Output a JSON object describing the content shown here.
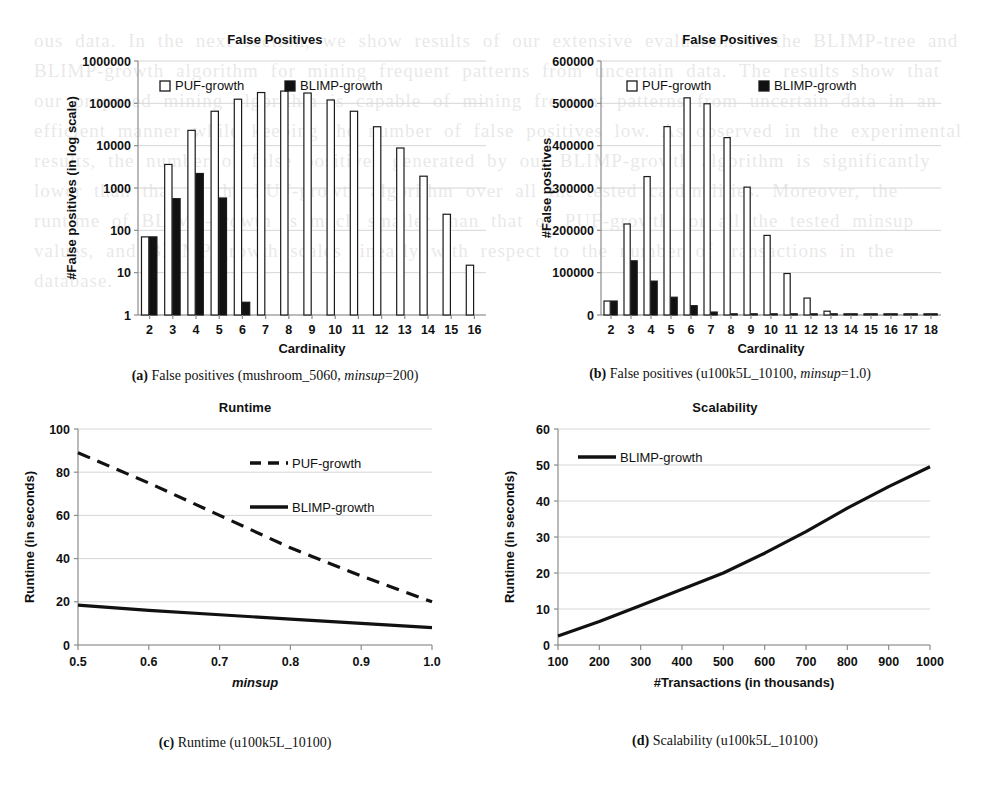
{
  "figure": {
    "panels": [
      {
        "id": "a",
        "title": "False Positives",
        "caption_label": "(a)",
        "caption_text": "False positives (mushroom_5060, ",
        "caption_italic": "minsup",
        "caption_tail": "=200)",
        "legend": [
          "PUF-growth",
          "BLIMP-growth"
        ]
      },
      {
        "id": "b",
        "title": "False Positives",
        "caption_label": "(b)",
        "caption_text": "False positives (u100k5L_10100, ",
        "caption_italic": "minsup",
        "caption_tail": "=1.0)",
        "legend": [
          "PUF-growth",
          "BLIMP-growth"
        ]
      },
      {
        "id": "c",
        "title": "Runtime",
        "caption_label": "(c)",
        "caption_text": "Runtime (u100k5L_10100)",
        "caption_italic": "",
        "caption_tail": "",
        "legend": [
          "PUF-growth",
          "BLIMP-growth"
        ]
      },
      {
        "id": "d",
        "title": "Scalability",
        "caption_label": "(d)",
        "caption_text": "Scalability (u100k5L_10100)",
        "caption_italic": "",
        "caption_tail": "",
        "legend": [
          "BLIMP-growth"
        ]
      }
    ]
  },
  "chart_data": [
    {
      "type": "bar",
      "id": "a",
      "title": "False Positives",
      "xlabel": "Cardinality",
      "ylabel": "#False positives (in log scale)",
      "yscale": "log",
      "ylim": [
        1,
        1000000
      ],
      "yticks": [
        1,
        10,
        100,
        1000,
        10000,
        100000,
        1000000
      ],
      "ytick_labels": [
        "1",
        "10",
        "100",
        "1000",
        "10000",
        "100000",
        "1000000"
      ],
      "categories": [
        2,
        3,
        4,
        5,
        6,
        7,
        8,
        9,
        10,
        11,
        12,
        13,
        14,
        15,
        16
      ],
      "grid": true,
      "legend_position": "top-left-inside",
      "series": [
        {
          "name": "PUF-growth",
          "fill": "#ffffff",
          "values": [
            70,
            3600,
            23000,
            65000,
            125000,
            180000,
            195000,
            175000,
            120000,
            65000,
            28000,
            8800,
            1900,
            240,
            15
          ]
        },
        {
          "name": "BLIMP-growth",
          "fill": "#111111",
          "values": [
            70,
            560,
            2200,
            580,
            2,
            0,
            0,
            0,
            0,
            0,
            0,
            0,
            0,
            0,
            0
          ]
        }
      ]
    },
    {
      "type": "bar",
      "id": "b",
      "title": "False Positives",
      "xlabel": "Cardinality",
      "ylabel": "#False positives",
      "yscale": "linear",
      "ylim": [
        0,
        600000
      ],
      "yticks": [
        0,
        100000,
        200000,
        300000,
        400000,
        500000,
        600000
      ],
      "ytick_labels": [
        "0",
        "100000",
        "200000",
        "300000",
        "400000",
        "500000",
        "600000"
      ],
      "categories": [
        2,
        3,
        4,
        5,
        6,
        7,
        8,
        9,
        10,
        11,
        12,
        13,
        14,
        15,
        16,
        17,
        18
      ],
      "grid": true,
      "legend_position": "top-left-inside",
      "series": [
        {
          "name": "PUF-growth",
          "fill": "#ffffff",
          "values": [
            33000,
            215000,
            327000,
            445000,
            513000,
            499000,
            419000,
            302000,
            188000,
            98000,
            40000,
            9000,
            2000,
            800,
            400,
            200,
            100
          ]
        },
        {
          "name": "BLIMP-growth",
          "fill": "#111111",
          "values": [
            33000,
            128000,
            80000,
            42000,
            22000,
            7000,
            2000,
            1000,
            500,
            300,
            200,
            100,
            2000,
            1000,
            800,
            600,
            400
          ]
        }
      ]
    },
    {
      "type": "line",
      "id": "c",
      "title": "Runtime",
      "xlabel": "minsup",
      "ylabel": "Runtime (in seconds)",
      "xlim": [
        0.5,
        1.0
      ],
      "ylim": [
        0,
        100
      ],
      "xticks": [
        0.5,
        0.6,
        0.7,
        0.8,
        0.9,
        1.0
      ],
      "xtick_labels": [
        "0.5",
        "0.6",
        "0.7",
        "0.8",
        "0.9",
        "1.0"
      ],
      "yticks": [
        0,
        20,
        40,
        60,
        80,
        100
      ],
      "ytick_labels": [
        "0",
        "20",
        "40",
        "60",
        "80",
        "100"
      ],
      "grid": true,
      "legend_position": "right-inside",
      "x": [
        0.5,
        0.6,
        0.7,
        0.8,
        0.9,
        1.0
      ],
      "series": [
        {
          "name": "PUF-growth",
          "style": "dashed",
          "values": [
            89,
            75,
            60,
            45,
            32,
            20
          ]
        },
        {
          "name": "BLIMP-growth",
          "style": "solid",
          "values": [
            18.5,
            16,
            14,
            12,
            10,
            8
          ]
        }
      ]
    },
    {
      "type": "line",
      "id": "d",
      "title": "Scalability",
      "xlabel": "#Transactions (in thousands)",
      "ylabel": "Runtime (in seconds)",
      "xlim": [
        100,
        1000
      ],
      "ylim": [
        0,
        60
      ],
      "xticks": [
        100,
        200,
        300,
        400,
        500,
        600,
        700,
        800,
        900,
        1000
      ],
      "xtick_labels": [
        "100",
        "200",
        "300",
        "400",
        "500",
        "600",
        "700",
        "800",
        "900",
        "1000"
      ],
      "yticks": [
        0,
        10,
        20,
        30,
        40,
        50,
        60
      ],
      "ytick_labels": [
        "0",
        "10",
        "20",
        "30",
        "40",
        "50",
        "60"
      ],
      "grid": true,
      "legend_position": "top-left-inside",
      "x": [
        100,
        200,
        300,
        400,
        500,
        600,
        700,
        800,
        900,
        1000
      ],
      "series": [
        {
          "name": "BLIMP-growth",
          "style": "solid",
          "values": [
            2.5,
            6.5,
            11,
            15.5,
            20,
            25.5,
            31.5,
            38,
            44,
            49.5
          ]
        }
      ]
    }
  ],
  "bleed_text": "ous data. In the next section, we show results of our extensive evaluation of the BLIMP-tree and BLIMP-growth algorithm for mining frequent patterns from uncertain data. The results show that our proposed mining algorithm is capable of mining frequent patterns from uncertain data in an efficient manner while keeping the number of false positives low. As observed in the experimental results, the number of false positives generated by our BLIMP-growth algorithm is significantly lower than that of the PUF-growth algorithm over all the tested cardinalities. Moreover, the runtime of BLIMP-growth is much smaller than that of PUF-growth for all the tested minsup values, and BLIMP-growth scales linearly with respect to the number of transactions in the database."
}
